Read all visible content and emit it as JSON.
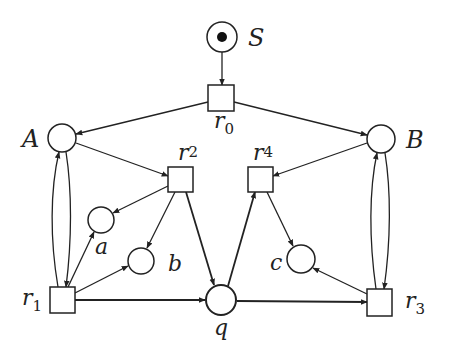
{
  "diagram": {
    "type": "petri-net",
    "places": [
      {
        "id": "S",
        "label": "S",
        "tokens": 1
      },
      {
        "id": "A",
        "label": "A",
        "tokens": 0
      },
      {
        "id": "B",
        "label": "B",
        "tokens": 0
      },
      {
        "id": "a",
        "label": "a",
        "tokens": 0
      },
      {
        "id": "b",
        "label": "b",
        "tokens": 0
      },
      {
        "id": "c",
        "label": "c",
        "tokens": 0
      },
      {
        "id": "q",
        "label": "q",
        "tokens": 0
      }
    ],
    "transitions": [
      {
        "id": "r0",
        "label": "r",
        "sub": "0"
      },
      {
        "id": "r1",
        "label": "r",
        "sub": "1"
      },
      {
        "id": "r2",
        "label": "r",
        "sub": "2"
      },
      {
        "id": "r3",
        "label": "r",
        "sub": "3"
      },
      {
        "id": "r4",
        "label": "r",
        "sub": "4"
      }
    ],
    "arcs": [
      [
        "S",
        "r0"
      ],
      [
        "r0",
        "A"
      ],
      [
        "r0",
        "B"
      ],
      [
        "A",
        "r2"
      ],
      [
        "r2",
        "a"
      ],
      [
        "r2",
        "b"
      ],
      [
        "r2",
        "q"
      ],
      [
        "A",
        "r1"
      ],
      [
        "r1",
        "A"
      ],
      [
        "r1",
        "a"
      ],
      [
        "r1",
        "b"
      ],
      [
        "r1",
        "q"
      ],
      [
        "B",
        "r4"
      ],
      [
        "r4",
        "c"
      ],
      [
        "q",
        "r4"
      ],
      [
        "B",
        "r3"
      ],
      [
        "r3",
        "B"
      ],
      [
        "r3",
        "c"
      ],
      [
        "q",
        "r3"
      ]
    ]
  }
}
